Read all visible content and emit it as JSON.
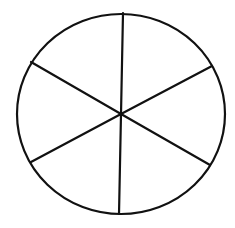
{
  "diagram": {
    "type": "circle-divided-into-sectors",
    "sector_count": 6,
    "stroke_color": "#111111",
    "fill_color": "#ffffff",
    "stroke_width": 2.2,
    "center": {
      "x": 121,
      "y": 114
    },
    "radius": {
      "rx": 104,
      "ry": 100
    },
    "spokes": [
      {
        "name": "spoke-top",
        "x2": 123,
        "y2": 13
      },
      {
        "name": "spoke-upper-right",
        "x2": 212,
        "y2": 66
      },
      {
        "name": "spoke-lower-right",
        "x2": 210,
        "y2": 165
      },
      {
        "name": "spoke-bottom",
        "x2": 119,
        "y2": 214
      },
      {
        "name": "spoke-lower-left",
        "x2": 31,
        "y2": 162
      },
      {
        "name": "spoke-upper-left",
        "x2": 31,
        "y2": 62
      }
    ]
  }
}
